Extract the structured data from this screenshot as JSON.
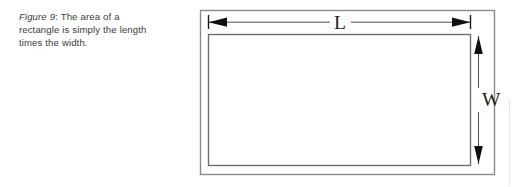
{
  "figure": {
    "caption": {
      "label": "Figure 9",
      "colon": ":",
      "body": " The area of a rectangle is simply the length times the width."
    },
    "diagram": {
      "type": "geometry-rectangle-dimensions",
      "shape_name": "rectangle",
      "labels": {
        "length": "L",
        "width": "W"
      },
      "annotations": [
        {
          "name": "length-dimension",
          "label": "L",
          "orientation": "horizontal",
          "arrow_style": "double-headed-with-end-ticks"
        },
        {
          "name": "width-dimension",
          "label": "W",
          "orientation": "vertical",
          "arrow_style": "double-headed"
        }
      ],
      "colors": {
        "outer_border": "#8a8a8a",
        "inner_border": "#6e6e6e",
        "arrow": "#1a1a1a",
        "label_text": "#1a1a1a",
        "background": "#ffffff"
      }
    }
  }
}
